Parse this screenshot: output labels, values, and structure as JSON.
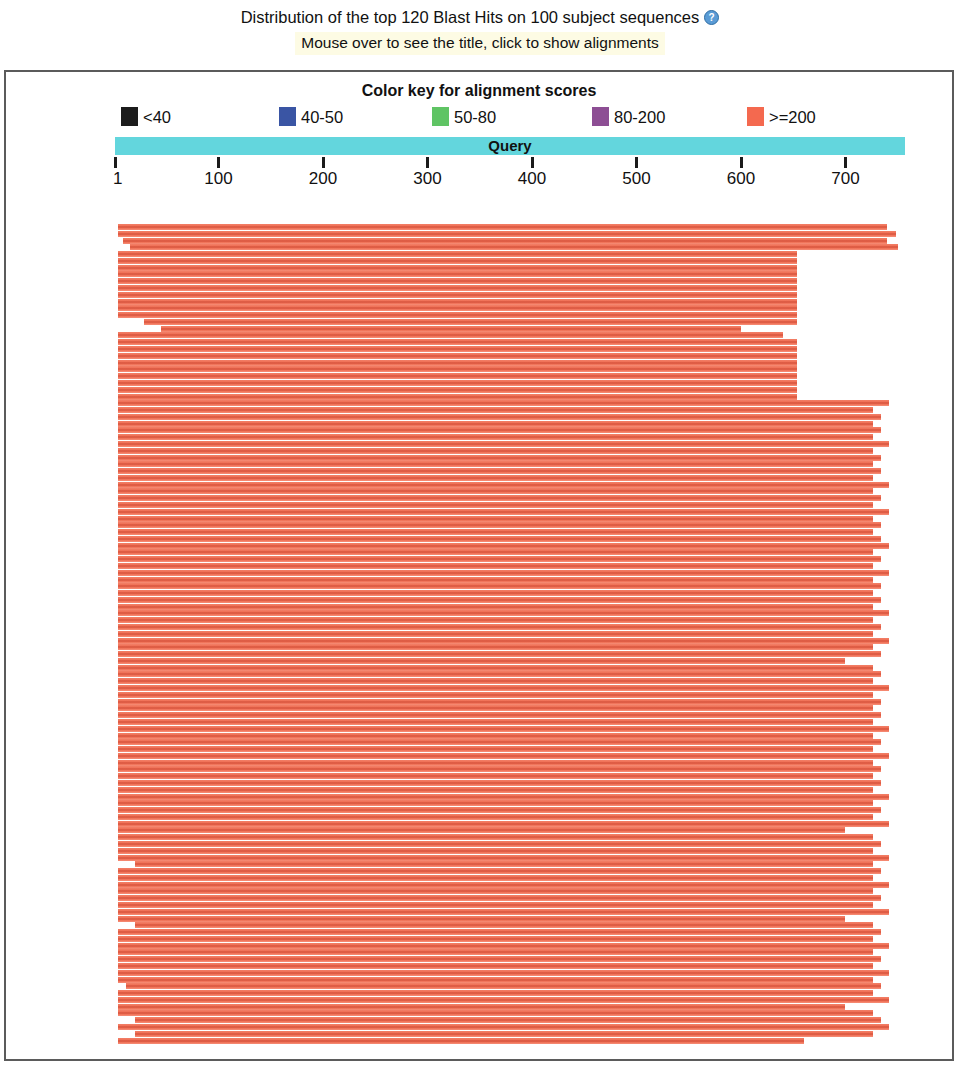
{
  "header": {
    "title": "Distribution of the top 120 Blast Hits on 100 subject sequences",
    "help_icon": "question-mark-circle-icon",
    "subtitle": "Mouse over to see the title, click to show alignments"
  },
  "color_key": {
    "title": "Color key for alignment scores",
    "items": [
      {
        "label": "<40",
        "color": "#1c1c1c",
        "left": 119
      },
      {
        "label": "40-50",
        "color": "#3a55a4",
        "left": 277
      },
      {
        "label": "50-80",
        "color": "#5fc464",
        "left": 430
      },
      {
        "label": "80-200",
        "color": "#8d4e94",
        "left": 590
      },
      {
        "label": ">=200",
        "color": "#f4694f",
        "left": 745
      }
    ]
  },
  "query": {
    "label": "Query",
    "bar_color": "#63d6dd",
    "axis": {
      "ticks": [
        1,
        100,
        200,
        300,
        400,
        500,
        600,
        700
      ],
      "tick_labels": [
        "1",
        "100",
        "200",
        "300",
        "400",
        "500",
        "600",
        "700"
      ],
      "range": [
        1,
        760
      ],
      "pixel_start": 113,
      "pixels_per_unit": 1.045
    }
  },
  "chart_data": {
    "type": "bar",
    "title": "Distribution of the top 120 Blast Hits on 100 subject sequences",
    "xlabel": "Query",
    "ylabel": "",
    "xlim": [
      1,
      760
    ],
    "grid": false,
    "legend": [
      "<40",
      "40-50",
      "50-80",
      "80-200",
      ">=200"
    ],
    "legend_position": "top",
    "note": "Each row is one BLAST hit alignment drawn as a horizontal bar spanning query start-end coordinates. All 120 bars are color >=200 (red).",
    "bar_color": "#f0705a",
    "hits": [
      {
        "start": 4,
        "end": 740
      },
      {
        "start": 4,
        "end": 748
      },
      {
        "start": 9,
        "end": 740
      },
      {
        "start": 15,
        "end": 750
      },
      {
        "start": 4,
        "end": 654
      },
      {
        "start": 4,
        "end": 654
      },
      {
        "start": 4,
        "end": 654
      },
      {
        "start": 4,
        "end": 654
      },
      {
        "start": 4,
        "end": 654
      },
      {
        "start": 4,
        "end": 654
      },
      {
        "start": 4,
        "end": 654
      },
      {
        "start": 4,
        "end": 654
      },
      {
        "start": 4,
        "end": 654
      },
      {
        "start": 4,
        "end": 654
      },
      {
        "start": 29,
        "end": 654
      },
      {
        "start": 45,
        "end": 600
      },
      {
        "start": 4,
        "end": 640
      },
      {
        "start": 4,
        "end": 654
      },
      {
        "start": 4,
        "end": 654
      },
      {
        "start": 4,
        "end": 654
      },
      {
        "start": 4,
        "end": 654
      },
      {
        "start": 4,
        "end": 654
      },
      {
        "start": 4,
        "end": 654
      },
      {
        "start": 4,
        "end": 654
      },
      {
        "start": 4,
        "end": 654
      },
      {
        "start": 4,
        "end": 654
      },
      {
        "start": 4,
        "end": 742
      },
      {
        "start": 4,
        "end": 726
      },
      {
        "start": 4,
        "end": 734
      },
      {
        "start": 4,
        "end": 726
      },
      {
        "start": 4,
        "end": 734
      },
      {
        "start": 4,
        "end": 726
      },
      {
        "start": 4,
        "end": 742
      },
      {
        "start": 4,
        "end": 726
      },
      {
        "start": 4,
        "end": 734
      },
      {
        "start": 4,
        "end": 726
      },
      {
        "start": 4,
        "end": 734
      },
      {
        "start": 4,
        "end": 726
      },
      {
        "start": 4,
        "end": 742
      },
      {
        "start": 4,
        "end": 726
      },
      {
        "start": 4,
        "end": 734
      },
      {
        "start": 4,
        "end": 726
      },
      {
        "start": 4,
        "end": 742
      },
      {
        "start": 4,
        "end": 726
      },
      {
        "start": 4,
        "end": 734
      },
      {
        "start": 4,
        "end": 726
      },
      {
        "start": 4,
        "end": 734
      },
      {
        "start": 4,
        "end": 742
      },
      {
        "start": 4,
        "end": 726
      },
      {
        "start": 4,
        "end": 734
      },
      {
        "start": 4,
        "end": 726
      },
      {
        "start": 4,
        "end": 742
      },
      {
        "start": 4,
        "end": 726
      },
      {
        "start": 4,
        "end": 734
      },
      {
        "start": 4,
        "end": 726
      },
      {
        "start": 4,
        "end": 734
      },
      {
        "start": 4,
        "end": 726
      },
      {
        "start": 4,
        "end": 742
      },
      {
        "start": 4,
        "end": 726
      },
      {
        "start": 4,
        "end": 734
      },
      {
        "start": 4,
        "end": 726
      },
      {
        "start": 4,
        "end": 742
      },
      {
        "start": 4,
        "end": 726
      },
      {
        "start": 4,
        "end": 734
      },
      {
        "start": 4,
        "end": 700
      },
      {
        "start": 4,
        "end": 726
      },
      {
        "start": 4,
        "end": 734
      },
      {
        "start": 4,
        "end": 726
      },
      {
        "start": 4,
        "end": 742
      },
      {
        "start": 4,
        "end": 726
      },
      {
        "start": 4,
        "end": 734
      },
      {
        "start": 4,
        "end": 726
      },
      {
        "start": 4,
        "end": 734
      },
      {
        "start": 4,
        "end": 726
      },
      {
        "start": 4,
        "end": 742
      },
      {
        "start": 4,
        "end": 726
      },
      {
        "start": 4,
        "end": 734
      },
      {
        "start": 4,
        "end": 726
      },
      {
        "start": 4,
        "end": 742
      },
      {
        "start": 4,
        "end": 726
      },
      {
        "start": 4,
        "end": 734
      },
      {
        "start": 4,
        "end": 726
      },
      {
        "start": 4,
        "end": 734
      },
      {
        "start": 4,
        "end": 726
      },
      {
        "start": 4,
        "end": 742
      },
      {
        "start": 4,
        "end": 726
      },
      {
        "start": 4,
        "end": 734
      },
      {
        "start": 4,
        "end": 726
      },
      {
        "start": 4,
        "end": 742
      },
      {
        "start": 4,
        "end": 700
      },
      {
        "start": 4,
        "end": 726
      },
      {
        "start": 4,
        "end": 734
      },
      {
        "start": 4,
        "end": 726
      },
      {
        "start": 4,
        "end": 742
      },
      {
        "start": 20,
        "end": 726
      },
      {
        "start": 4,
        "end": 734
      },
      {
        "start": 4,
        "end": 726
      },
      {
        "start": 4,
        "end": 742
      },
      {
        "start": 4,
        "end": 726
      },
      {
        "start": 4,
        "end": 734
      },
      {
        "start": 4,
        "end": 726
      },
      {
        "start": 4,
        "end": 742
      },
      {
        "start": 4,
        "end": 700
      },
      {
        "start": 20,
        "end": 726
      },
      {
        "start": 4,
        "end": 734
      },
      {
        "start": 4,
        "end": 726
      },
      {
        "start": 4,
        "end": 742
      },
      {
        "start": 4,
        "end": 726
      },
      {
        "start": 4,
        "end": 734
      },
      {
        "start": 4,
        "end": 726
      },
      {
        "start": 4,
        "end": 742
      },
      {
        "start": 4,
        "end": 726
      },
      {
        "start": 12,
        "end": 734
      },
      {
        "start": 4,
        "end": 726
      },
      {
        "start": 4,
        "end": 742
      },
      {
        "start": 4,
        "end": 700
      },
      {
        "start": 4,
        "end": 726
      },
      {
        "start": 20,
        "end": 734
      },
      {
        "start": 4,
        "end": 742
      },
      {
        "start": 20,
        "end": 726
      },
      {
        "start": 4,
        "end": 660
      }
    ]
  }
}
